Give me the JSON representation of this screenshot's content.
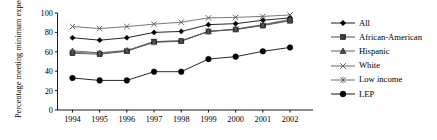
{
  "chart_data": {
    "type": "line",
    "title": "",
    "xlabel": "",
    "ylabel": "Percentage meeting minimum expectations",
    "categories": [
      "1994",
      "1995",
      "1996",
      "1997",
      "1998",
      "1999",
      "2000",
      "2001",
      "2002"
    ],
    "x": [
      1994,
      1995,
      1996,
      1997,
      1998,
      1999,
      2000,
      2001,
      2002
    ],
    "ylim": [
      0,
      100
    ],
    "yticks": [
      0,
      20,
      40,
      60,
      80,
      100
    ],
    "grid": false,
    "legend_position": "right",
    "series": [
      {
        "name": "All",
        "marker": "diamond",
        "color": "#000000",
        "values": [
          74.5,
          72.0,
          74.5,
          80.0,
          81.0,
          88.0,
          89.0,
          92.5,
          95.0
        ]
      },
      {
        "name": "African-American",
        "marker": "square",
        "color": "#3a3a3a",
        "values": [
          58.5,
          57.5,
          60.5,
          70.5,
          71.0,
          81.0,
          83.0,
          87.0,
          92.0
        ]
      },
      {
        "name": "Hispanic",
        "marker": "triangle",
        "color": "#4a4a4a",
        "values": [
          61.0,
          59.0,
          61.5,
          70.5,
          71.5,
          81.0,
          83.5,
          88.0,
          93.5
        ]
      },
      {
        "name": "White",
        "marker": "x",
        "color": "#555555",
        "values": [
          86.0,
          84.0,
          86.0,
          88.5,
          90.5,
          95.0,
          95.5,
          96.5,
          98.0
        ]
      },
      {
        "name": "Low income",
        "marker": "asterisk",
        "color": "#5a5a5a",
        "values": [
          59.5,
          58.5,
          61.0,
          69.5,
          71.0,
          81.0,
          83.0,
          87.5,
          92.5
        ]
      },
      {
        "name": "LEP",
        "marker": "circle",
        "color": "#000000",
        "values": [
          33.0,
          30.5,
          30.5,
          39.5,
          39.5,
          52.5,
          55.0,
          60.5,
          64.5
        ]
      }
    ]
  },
  "axes": {
    "y_tick_labels": [
      "0",
      "20",
      "40",
      "60",
      "80",
      "100"
    ],
    "x_tick_labels": [
      "1994",
      "1995",
      "1996",
      "1997",
      "1998",
      "1999",
      "2000",
      "2001",
      "2002"
    ],
    "y_axis_title": "Percentage meeting minimum expectations"
  },
  "legend": {
    "items": [
      {
        "label": "All",
        "marker": "diamond"
      },
      {
        "label": "African-American",
        "marker": "square"
      },
      {
        "label": "Hispanic",
        "marker": "triangle"
      },
      {
        "label": "White",
        "marker": "x"
      },
      {
        "label": "Low income",
        "marker": "asterisk"
      },
      {
        "label": "LEP",
        "marker": "circle"
      }
    ]
  }
}
